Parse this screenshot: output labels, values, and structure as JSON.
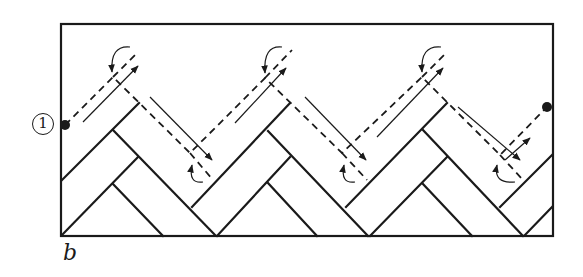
{
  "labels": {
    "start_marker": "1",
    "figure_letter": "b"
  },
  "colors": {
    "ink": "#1a1a1a",
    "background": "#ffffff"
  },
  "frame": {
    "x": 61,
    "y": 24,
    "width": 492,
    "height": 212
  },
  "start_point": {
    "x": 65,
    "y": 125
  },
  "end_point": {
    "x": 547,
    "y": 107
  },
  "dashed_path": [
    [
      65,
      125
    ],
    [
      113,
      77
    ],
    [
      190,
      153
    ],
    [
      265,
      78
    ],
    [
      342,
      153
    ],
    [
      422,
      77
    ],
    [
      500,
      155
    ],
    [
      547,
      107
    ]
  ],
  "top_vertices": [
    {
      "x": 113,
      "y": 77,
      "tail": [
        138,
        52
      ],
      "arrow_from": [
        83,
        122
      ],
      "arrow_to": [
        138,
        66
      ],
      "curve_from": [
        130,
        47
      ],
      "curve_to": [
        112,
        72
      ]
    },
    {
      "x": 265,
      "y": 78,
      "tail": [
        292,
        50
      ],
      "arrow_from": [
        235,
        123
      ],
      "arrow_to": [
        286,
        68
      ],
      "curve_from": [
        282,
        47
      ],
      "curve_to": [
        265,
        73
      ]
    },
    {
      "x": 422,
      "y": 77,
      "tail": [
        447,
        52
      ],
      "arrow_from": [
        377,
        137
      ],
      "arrow_to": [
        443,
        68
      ],
      "curve_from": [
        441,
        47
      ],
      "curve_to": [
        422,
        72
      ]
    }
  ],
  "bottom_vertices": [
    {
      "x": 190,
      "y": 153,
      "tail": [
        213,
        180
      ],
      "arrow_from": [
        150,
        97
      ],
      "arrow_to": [
        212,
        160
      ],
      "curve_from": [
        203,
        182
      ],
      "curve_to": [
        192,
        165
      ]
    },
    {
      "x": 342,
      "y": 153,
      "tail": [
        367,
        180
      ],
      "arrow_from": [
        305,
        97
      ],
      "arrow_to": [
        366,
        160
      ],
      "curve_from": [
        355,
        182
      ],
      "curve_to": [
        344,
        165
      ]
    },
    {
      "x": 500,
      "y": 155,
      "tail": [
        523,
        180
      ],
      "arrow_from": [
        458,
        107
      ],
      "arrow_to": [
        520,
        160
      ],
      "curve_from": [
        515,
        182
      ],
      "curve_to": [
        497,
        165
      ]
    }
  ],
  "final_arrow": {
    "from": [
      505,
      160
    ],
    "to": [
      530,
      138
    ]
  },
  "board_lines": [
    [
      [
        62,
        180
      ],
      [
        139,
        103
      ]
    ],
    [
      [
        113,
        130
      ],
      [
        215,
        235
      ]
    ],
    [
      [
        62,
        235
      ],
      [
        138,
        157
      ]
    ],
    [
      [
        113,
        184
      ],
      [
        163,
        236
      ]
    ],
    [
      [
        192,
        207
      ],
      [
        290,
        103
      ]
    ],
    [
      [
        268,
        131
      ],
      [
        368,
        236
      ]
    ],
    [
      [
        217,
        236
      ],
      [
        290,
        157
      ]
    ],
    [
      [
        268,
        183
      ],
      [
        317,
        236
      ]
    ],
    [
      [
        346,
        207
      ],
      [
        447,
        103
      ]
    ],
    [
      [
        423,
        130
      ],
      [
        523,
        236
      ]
    ],
    [
      [
        370,
        236
      ],
      [
        447,
        157
      ]
    ],
    [
      [
        423,
        184
      ],
      [
        472,
        236
      ]
    ],
    [
      [
        500,
        207
      ],
      [
        552,
        155
      ]
    ],
    [
      [
        525,
        235
      ],
      [
        552,
        207
      ]
    ]
  ]
}
